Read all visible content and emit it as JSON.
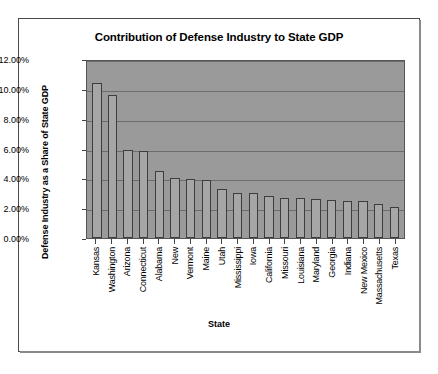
{
  "chart_data": {
    "type": "bar",
    "title": "Contribution of Defense Industry to State GDP",
    "xlabel": "State",
    "ylabel": "Defense Industry as a Share of State GDP",
    "categories": [
      "Kansas",
      "Washington",
      "Arizona",
      "Connecticut",
      "Alabama",
      "New",
      "Vermont",
      "Maine",
      "Utah",
      "Mississippi",
      "Iowa",
      "California",
      "Missouri",
      "Louisiana",
      "Maryland",
      "Georgia",
      "Indiana",
      "New Mexico",
      "Massachusetts",
      "Texas"
    ],
    "values": [
      10.4,
      9.6,
      5.9,
      5.85,
      4.5,
      4.0,
      3.95,
      3.9,
      3.3,
      3.05,
      3.0,
      2.8,
      2.7,
      2.65,
      2.6,
      2.55,
      2.5,
      2.45,
      2.3,
      2.1
    ],
    "ylim": [
      0,
      12
    ],
    "ytick_labels": [
      "12.00%",
      "10.00%",
      "8.00%",
      "6.00%",
      "4.00%",
      "2.00%",
      "0.00%"
    ],
    "ytick_values": [
      12,
      10,
      8,
      6,
      4,
      2,
      0
    ],
    "grid": true,
    "legend": false,
    "plot_background": "#9a9a9a",
    "bar_color": "#a6a6a6",
    "bar_border": "#3d3d3d"
  }
}
